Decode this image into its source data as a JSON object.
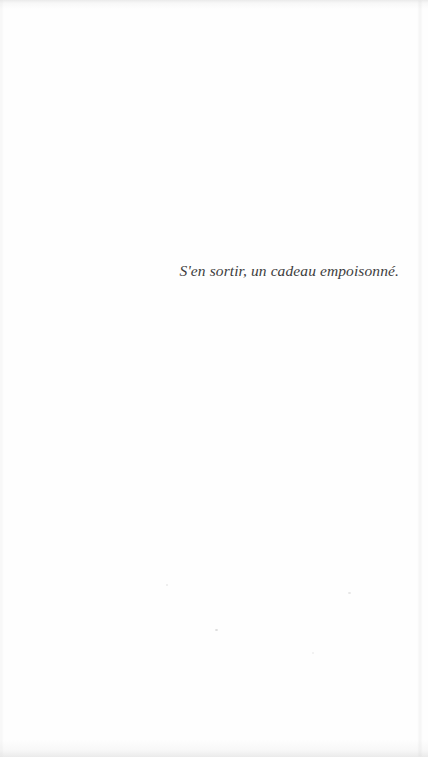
{
  "page": {
    "epigraph": "S'en sortir, un cadeau empoisonné."
  },
  "colors": {
    "page_background": "#fefefe",
    "epigraph_text": "#3d3d3d"
  }
}
